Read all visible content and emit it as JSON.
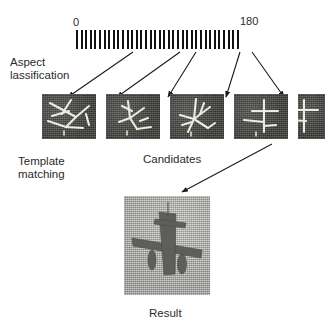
{
  "figure": {
    "caption_labels": {
      "aspect_classification": "Aspect\nlassification",
      "template_matching": "Template\nmatching",
      "candidates": "Candidates",
      "result": "Result"
    },
    "scale": {
      "min_label": "0",
      "max_label": "180",
      "tick_count": 36,
      "units": "degrees"
    },
    "candidates": [
      {
        "id": "candidate-1",
        "aspect_index": 7
      },
      {
        "id": "candidate-2",
        "aspect_index": 16
      },
      {
        "id": "candidate-3",
        "aspect_index": 20
      },
      {
        "id": "candidate-4",
        "aspect_index": 30
      },
      {
        "id": "candidate-5",
        "aspect_index": 33
      }
    ],
    "colors": {
      "ink": "#1a1a1a",
      "tick": "#111111",
      "candidate_background": "#4d4d48",
      "candidate_sketch": "#eceae2",
      "result_background": "#bdbdb9",
      "result_target": "#5e5e5c"
    }
  }
}
